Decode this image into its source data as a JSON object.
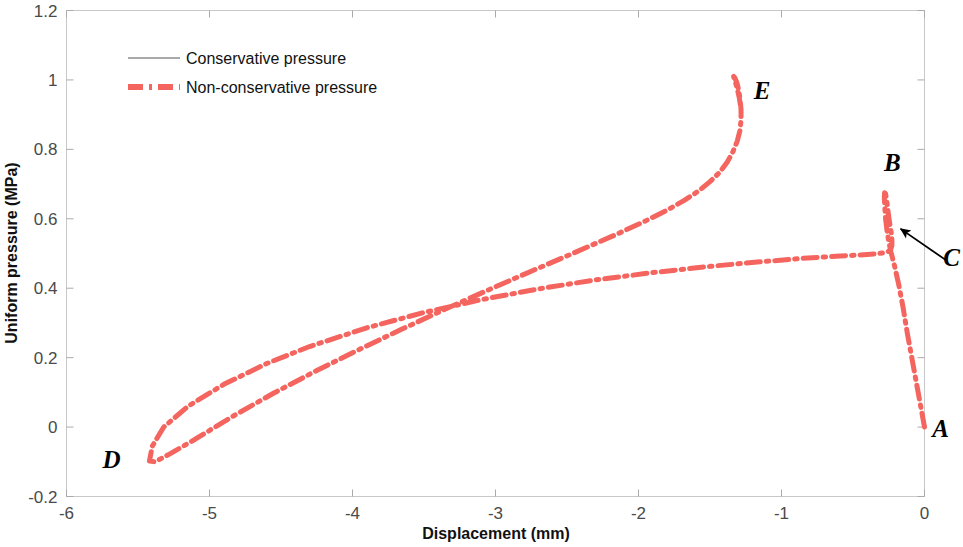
{
  "chart_data": {
    "type": "line",
    "title": "",
    "xlabel": "Displacement (mm)",
    "ylabel": "Uniform pressure (MPa)",
    "xlim": [
      -6,
      0
    ],
    "ylim": [
      -0.2,
      1.2
    ],
    "xticks": [
      -6,
      -5,
      -4,
      -3,
      -2,
      -1,
      0
    ],
    "xticklabels": [
      "-6",
      "-5",
      "-4",
      "-3",
      "-2",
      "-1",
      "0"
    ],
    "yticks": [
      -0.2,
      0,
      0.2,
      0.4,
      0.6,
      0.8,
      1,
      1.2
    ],
    "yticklabels": [
      "-0.2",
      "0",
      "0.2",
      "0.4",
      "0.6",
      "0.8",
      "1",
      "1.2"
    ],
    "grid": false,
    "legend_position": "upper-left",
    "series": [
      {
        "name": "Conservative pressure",
        "style": "solid",
        "color": "#555555",
        "width": 1,
        "points": []
      },
      {
        "name": "Non-conservative pressure",
        "style": "dash-dot",
        "color": "#f4655f",
        "width": 5,
        "points": [
          [
            0.0,
            0.0
          ],
          [
            -0.04,
            0.09
          ],
          [
            -0.08,
            0.18
          ],
          [
            -0.12,
            0.27
          ],
          [
            -0.15,
            0.345
          ],
          [
            -0.18,
            0.41
          ],
          [
            -0.21,
            0.465
          ],
          [
            -0.235,
            0.505
          ],
          [
            -0.25,
            0.535
          ],
          [
            -0.262,
            0.565
          ],
          [
            -0.272,
            0.6
          ],
          [
            -0.278,
            0.635
          ],
          [
            -0.281,
            0.662
          ],
          [
            -0.279,
            0.675
          ],
          [
            -0.272,
            0.672
          ],
          [
            -0.264,
            0.652
          ],
          [
            -0.256,
            0.625
          ],
          [
            -0.248,
            0.6
          ],
          [
            -0.24,
            0.578
          ],
          [
            -0.232,
            0.558
          ],
          [
            -0.228,
            0.54
          ],
          [
            -0.228,
            0.523
          ],
          [
            -0.236,
            0.512
          ],
          [
            -0.252,
            0.506
          ],
          [
            -0.28,
            0.502
          ],
          [
            -0.34,
            0.499
          ],
          [
            -0.45,
            0.496
          ],
          [
            -0.62,
            0.492
          ],
          [
            -0.85,
            0.486
          ],
          [
            -1.15,
            0.476
          ],
          [
            -1.5,
            0.463
          ],
          [
            -1.9,
            0.445
          ],
          [
            -2.3,
            0.424
          ],
          [
            -2.7,
            0.398
          ],
          [
            -3.1,
            0.367
          ],
          [
            -3.5,
            0.33
          ],
          [
            -3.9,
            0.286
          ],
          [
            -4.3,
            0.232
          ],
          [
            -4.6,
            0.183
          ],
          [
            -4.9,
            0.123
          ],
          [
            -5.15,
            0.06
          ],
          [
            -5.32,
            0.0
          ],
          [
            -5.4,
            -0.055
          ],
          [
            -5.42,
            -0.098
          ],
          [
            -5.38,
            -0.1
          ],
          [
            -5.28,
            -0.078
          ],
          [
            -5.1,
            -0.035
          ],
          [
            -4.85,
            0.028
          ],
          [
            -4.55,
            0.098
          ],
          [
            -4.25,
            0.163
          ],
          [
            -3.95,
            0.224
          ],
          [
            -3.65,
            0.283
          ],
          [
            -3.35,
            0.34
          ],
          [
            -3.05,
            0.395
          ],
          [
            -2.75,
            0.449
          ],
          [
            -2.45,
            0.502
          ],
          [
            -2.15,
            0.556
          ],
          [
            -1.95,
            0.594
          ],
          [
            -1.8,
            0.625
          ],
          [
            -1.68,
            0.653
          ],
          [
            -1.58,
            0.68
          ],
          [
            -1.5,
            0.707
          ],
          [
            -1.43,
            0.735
          ],
          [
            -1.38,
            0.763
          ],
          [
            -1.34,
            0.793
          ],
          [
            -1.31,
            0.823
          ],
          [
            -1.29,
            0.855
          ],
          [
            -1.283,
            0.885
          ],
          [
            -1.283,
            0.915
          ],
          [
            -1.29,
            0.945
          ],
          [
            -1.3,
            0.972
          ],
          [
            -1.312,
            0.992
          ],
          [
            -1.325,
            1.005
          ],
          [
            -1.335,
            1.01
          ],
          [
            -1.322,
            0.993
          ],
          [
            -1.308,
            0.972
          ],
          [
            -1.296,
            0.95
          ],
          [
            -1.288,
            0.93
          ],
          [
            -1.284,
            0.92
          ]
        ]
      }
    ],
    "annotations": [
      {
        "label": "A",
        "x": 0.0,
        "y": 0.0,
        "dx": 16,
        "dy": 10,
        "arrow": false
      },
      {
        "label": "B",
        "x": -0.28,
        "y": 0.675,
        "dx": 8,
        "dy": -22,
        "arrow": false
      },
      {
        "label": "C",
        "x": -0.23,
        "y": 0.545,
        "dx": 60,
        "dy": 28,
        "arrow": true
      },
      {
        "label": "D",
        "x": -5.42,
        "y": -0.1,
        "dx": -38,
        "dy": 6,
        "arrow": false
      },
      {
        "label": "E",
        "x": -1.29,
        "y": 0.935,
        "dx": 22,
        "dy": -3,
        "arrow": false
      }
    ]
  },
  "axes": {
    "box_color": "#c8c8c8",
    "tick_color": "#aaaaaa",
    "label_color": "#4a4a4a"
  },
  "legend": {
    "entries": [
      {
        "label": "Conservative pressure",
        "style": "solid",
        "color": "#555555"
      },
      {
        "label": "Non-conservative pressure",
        "style": "dash-dot",
        "color": "#f4655f"
      }
    ]
  }
}
